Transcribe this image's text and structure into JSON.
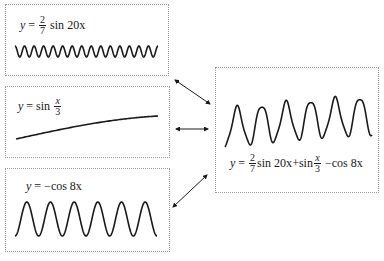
{
  "diagram": {
    "components": [
      {
        "id": "wave-a",
        "formula": {
          "lhs": "y",
          "eq": "=",
          "coef_num": "2",
          "coef_den": "7",
          "func": "sin",
          "arg": "20x"
        },
        "function": {
          "amplitude": 0.2857,
          "kind": "sin",
          "frequency": 20
        },
        "cycles_shown": 15
      },
      {
        "id": "wave-b",
        "formula": {
          "lhs": "y",
          "eq": "=",
          "func": "sin",
          "arg_num": "x",
          "arg_den": "3"
        },
        "function": {
          "amplitude": 1,
          "kind": "sin",
          "frequency": 0.3333
        }
      },
      {
        "id": "wave-c",
        "formula": {
          "lhs": "y",
          "eq": "=",
          "text": "−cos 8x"
        },
        "function": {
          "amplitude": -1,
          "kind": "cos",
          "frequency": 8
        },
        "cycles_shown": 6
      }
    ],
    "result": {
      "id": "sum-wave",
      "formula": {
        "lhs": "y",
        "eq": "=",
        "t1_num": "2",
        "t1_den": "7",
        "t1_rest": "sin 20x",
        "plus": "+",
        "t2_func": "sin",
        "t2_num": "x",
        "t2_den": "3",
        "t3": "−cos 8x"
      },
      "operation": "sum",
      "peaks_shown": 6
    },
    "arrows": [
      {
        "from": "wave-a",
        "to": "sum-wave",
        "type": "double-headed"
      },
      {
        "from": "wave-b",
        "to": "sum-wave",
        "type": "double-headed"
      },
      {
        "from": "wave-c",
        "to": "sum-wave",
        "type": "double-headed"
      }
    ],
    "colors": {
      "stroke": "#1a1a1a",
      "border": "#9a9a9a",
      "background": "#ffffff"
    }
  }
}
